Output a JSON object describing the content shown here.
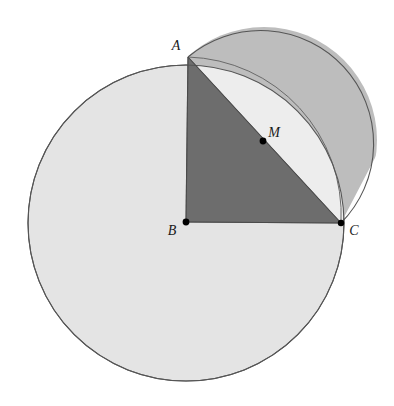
{
  "figure": {
    "background_color": "#ffffff",
    "width": 394,
    "height": 406
  },
  "labels": {
    "a": "A",
    "b": "B",
    "c": "C",
    "m": "M"
  },
  "colors": {
    "big_circle_fill": "#e4e4e4",
    "semicircle_fill": "#bdbdbd",
    "triangle_fill": "#6d6d6d",
    "lune_fill": "#ededed",
    "stroke": "#555555",
    "point": "#000000",
    "label_text": "#1a1a1a"
  },
  "points": {
    "A": {
      "x": 188,
      "y": 57,
      "label": "A",
      "label_x": 176,
      "label_y": 50,
      "dot": false
    },
    "B": {
      "x": 186,
      "y": 222,
      "label": "B",
      "label_x": 172,
      "label_y": 235,
      "dot": true
    },
    "C": {
      "x": 341,
      "y": 223,
      "label": "C",
      "label_x": 352,
      "label_y": 234,
      "dot": true
    },
    "M": {
      "x": 263,
      "y": 141,
      "label": "M",
      "label_x": 272,
      "label_y": 137,
      "dot": true
    }
  },
  "shapes": {
    "big_circle": {
      "cx": 186,
      "cy": 223,
      "r": 158,
      "fill": "#e4e4e4"
    },
    "semicircle_on_AC": {
      "cx": 264,
      "cy": 140,
      "r": 113,
      "fill": "#bdbdbd"
    },
    "triangle_ABC": {
      "fill": "#6d6d6d"
    },
    "lune_AC": {
      "fill": "#ededed"
    }
  },
  "geometry_notes": {
    "right_angle_at": "B",
    "M_is": "midpoint of AC",
    "semicircle_diameter": "AC",
    "big_circle_center": "B"
  }
}
